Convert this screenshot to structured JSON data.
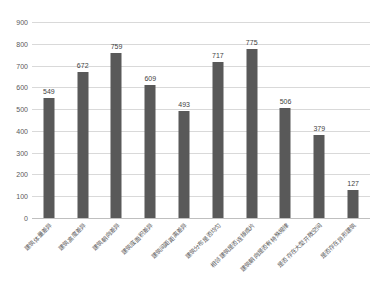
{
  "chart_data": {
    "type": "bar",
    "title": "",
    "xlabel": "",
    "ylabel": "",
    "ylim": [
      0,
      900
    ],
    "ytick_step": 100,
    "yticks": [
      0,
      100,
      200,
      300,
      400,
      500,
      600,
      700,
      800,
      900
    ],
    "grid": true,
    "legend": false,
    "bar_color": "#595959",
    "gridline_color": "#d9d9d9",
    "axis_color": "#bfbfbf",
    "label_color": "#5a5a5a",
    "value_label_color": "#3f3f3f",
    "background": "#ffffff",
    "xlabel_rotation_degrees": -45,
    "categories": [
      "建筑体量差异",
      "建筑高度差异",
      "建筑朝向差异",
      "建筑底面积差异",
      "建筑间距距离差异",
      "建筑分布是否均匀",
      "相邻建筑是否连接成片",
      "建筑朝向是否有特殊规律",
      "是否存在大型开敞空间",
      "是否存在异形建筑"
    ],
    "values": [
      549,
      672,
      759,
      609,
      493,
      717,
      775,
      506,
      379,
      127
    ],
    "series": [
      {
        "name": "",
        "values": [
          549,
          672,
          759,
          609,
          493,
          717,
          775,
          506,
          379,
          127
        ]
      }
    ]
  }
}
